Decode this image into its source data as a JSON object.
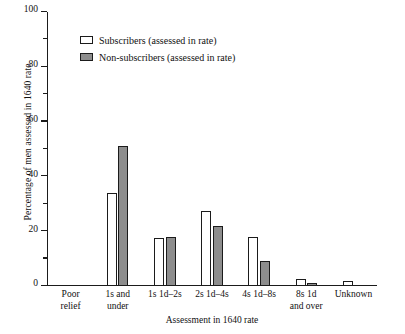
{
  "chart_data": {
    "type": "bar",
    "title": "",
    "xlabel": "Assessment in 1640 rate",
    "ylabel": "Percentage of men assessed in 1640 rate",
    "categories": [
      "Poor relief",
      "1s and under",
      "1s 1d–2s",
      "2s 1d–4s",
      "4s 1d–8s",
      "8s 1d and over",
      "Unknown"
    ],
    "category_lines": [
      [
        "Poor",
        "relief"
      ],
      [
        "1s and",
        "under"
      ],
      [
        "1s 1d–2s",
        ""
      ],
      [
        "2s 1d–4s",
        ""
      ],
      [
        "4s 1d–8s",
        ""
      ],
      [
        "8s 1d",
        "and over"
      ],
      [
        "Unknown",
        ""
      ]
    ],
    "series": [
      {
        "name": "Subscribers (assessed in rate)",
        "color": "#ffffff",
        "values": [
          0,
          34,
          17.5,
          27.5,
          18,
          2.5,
          2
        ]
      },
      {
        "name": "Non-subscribers (assessed in rate)",
        "color": "#8d8d8d",
        "values": [
          0,
          51,
          18,
          22,
          9,
          1,
          0
        ]
      }
    ],
    "ylim": [
      0,
      100
    ],
    "y_ticks": [
      0,
      20,
      40,
      60,
      80,
      100
    ],
    "y_minor_ticks": [
      10,
      30,
      50,
      70,
      90
    ],
    "grid": false,
    "legend_position": "upper left"
  },
  "legend": {
    "entries": [
      {
        "label": "Subscribers (assessed in rate)",
        "swatch": "white-square-icon"
      },
      {
        "label": "Non-subscribers (assessed in rate)",
        "swatch": "grey-square-icon"
      }
    ]
  },
  "axes": {
    "y_title": "Percentage of men assessed in 1640 rate",
    "x_title": "Assessment in 1640 rate",
    "y_tick_labels": [
      "0",
      "20",
      "40",
      "60",
      "80",
      "100"
    ]
  }
}
